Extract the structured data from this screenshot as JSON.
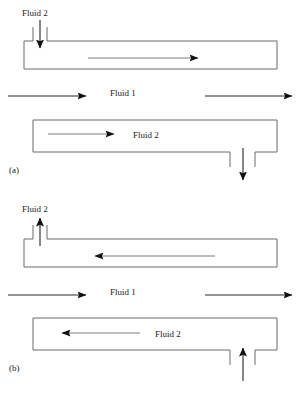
{
  "figure": {
    "type": "flow-diagram",
    "panels": [
      {
        "id": "a",
        "caption": "(a)",
        "flow_arrangement": "co-current",
        "labels": {
          "inlet_label": "Fluid 2",
          "middle_label": "Fluid 1",
          "lower_channel_label": "Fluid 2"
        },
        "channels": [
          {
            "name": "upper-channel",
            "fluid": "Fluid 2",
            "internal_flow_direction": "right",
            "port": {
              "position": "top-left",
              "type": "inlet",
              "arrow_direction": "down"
            }
          },
          {
            "name": "lower-channel",
            "fluid": "Fluid 2",
            "internal_flow_direction": "right",
            "port": {
              "position": "bottom-right",
              "type": "outlet",
              "arrow_direction": "down"
            }
          }
        ],
        "cross_flow": {
          "fluid": "Fluid 1",
          "arrows": [
            {
              "name": "left-arrow",
              "direction": "right"
            },
            {
              "name": "right-arrow",
              "direction": "right"
            }
          ]
        }
      },
      {
        "id": "b",
        "caption": "(b)",
        "flow_arrangement": "counter-current",
        "labels": {
          "inlet_label": "Fluid 2",
          "middle_label": "Fluid 1",
          "lower_channel_label": "Fluid 2"
        },
        "channels": [
          {
            "name": "upper-channel",
            "fluid": "Fluid 2",
            "internal_flow_direction": "left",
            "port": {
              "position": "top-left",
              "type": "outlet",
              "arrow_direction": "up"
            }
          },
          {
            "name": "lower-channel",
            "fluid": "Fluid 2",
            "internal_flow_direction": "left",
            "port": {
              "position": "bottom-right",
              "type": "inlet",
              "arrow_direction": "up"
            }
          }
        ],
        "cross_flow": {
          "fluid": "Fluid 1",
          "arrows": [
            {
              "name": "left-arrow",
              "direction": "right"
            },
            {
              "name": "right-arrow",
              "direction": "right"
            }
          ]
        }
      }
    ]
  },
  "colors": {
    "line": "#6b6b6b",
    "arrow": "#111111",
    "text": "#1a1a1a",
    "background": "#ffffff"
  }
}
